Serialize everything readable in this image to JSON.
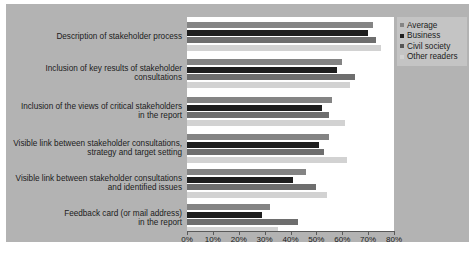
{
  "chart_data": {
    "type": "bar",
    "orientation": "horizontal",
    "title": "",
    "xlabel": "",
    "ylabel": "",
    "xlim": [
      0,
      80
    ],
    "grid": false,
    "legend_position": "top-right",
    "tick_labels": [
      "0%",
      "10%",
      "20%",
      "30%",
      "40%",
      "50%",
      "60%",
      "70%",
      "80%"
    ],
    "tick_values": [
      0,
      10,
      20,
      30,
      40,
      50,
      60,
      70,
      80
    ],
    "categories": [
      "Description of stakeholder process",
      "Inclusion of key results of stakeholder consultations",
      "Inclusion of the views of critical stakeholders in the report",
      "Visible link between stakeholder consultations, strategy and target setting",
      "Visible link between stakeholder consultations and identified issues",
      "Feedback card (or mail address) in the report"
    ],
    "category_lines": [
      [
        "Description of stakeholder process"
      ],
      [
        "Inclusion of key results of stakeholder",
        "consultations"
      ],
      [
        "Inclusion of the views of critical stakeholders",
        "in the report"
      ],
      [
        "Visible link between stakeholder consultations,",
        "strategy and target setting"
      ],
      [
        "Visible link between stakeholder consultations",
        "and identified issues"
      ],
      [
        "Feedback card (or mail address)",
        "in the report"
      ]
    ],
    "series": [
      {
        "name": "Average",
        "color": "#848484",
        "values": [
          72,
          60,
          56,
          55,
          46,
          32
        ]
      },
      {
        "name": "Business",
        "color": "#1e1e1e",
        "values": [
          70,
          58,
          52,
          51,
          41,
          29
        ]
      },
      {
        "name": "Civil society",
        "color": "#6e6e6e",
        "values": [
          73,
          65,
          55,
          53,
          50,
          43
        ]
      },
      {
        "name": "Other readers",
        "color": "#d2d2d2",
        "values": [
          75,
          63,
          61,
          62,
          54,
          35
        ]
      }
    ]
  },
  "legend": {
    "items": [
      {
        "label": "Average"
      },
      {
        "label": "Business"
      },
      {
        "label": "Civil society"
      },
      {
        "label": "Other readers"
      }
    ]
  }
}
